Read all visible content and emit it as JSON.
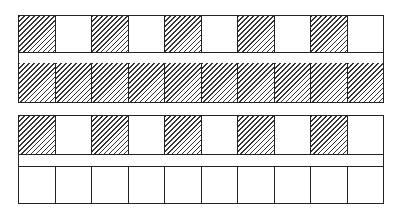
{
  "diagram": {
    "groups": [
      {
        "name": "top-group",
        "rows": [
          {
            "name": "row-1",
            "pattern": [
              1,
              0,
              1,
              0,
              1,
              0,
              1,
              0,
              1,
              0
            ]
          },
          {
            "name": "row-2",
            "pattern": [
              1,
              1,
              1,
              1,
              1,
              1,
              1,
              1,
              1,
              1
            ]
          }
        ]
      },
      {
        "name": "bottom-group",
        "rows": [
          {
            "name": "row-1",
            "pattern": [
              1,
              0,
              1,
              0,
              1,
              0,
              1,
              0,
              1,
              0
            ]
          },
          {
            "name": "row-2",
            "pattern": [
              0,
              0,
              0,
              0,
              0,
              0,
              0,
              0,
              0,
              0
            ]
          }
        ]
      }
    ],
    "legend": {
      "hatched": "filled cell",
      "blank": "empty cell"
    },
    "line_color": "#222222"
  }
}
